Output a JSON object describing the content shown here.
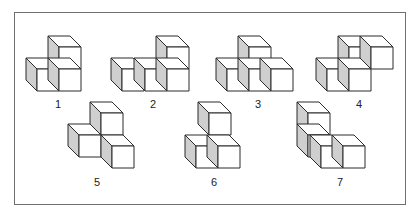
{
  "diagram": {
    "colors": {
      "frame": "#6f6f6f",
      "edge": "#2a2a2a",
      "front_face": "#ffffff",
      "top_face": "#ffffff",
      "side_face": "#cfcfcf"
    },
    "cube": {
      "size": 22,
      "depth": 11
    },
    "figures": [
      {
        "label": "1",
        "label_pos": [
          58,
          104
        ],
        "cubes": [
          [
            59,
            47
          ],
          [
            37,
            69
          ],
          [
            59,
            69
          ]
        ]
      },
      {
        "label": "2",
        "label_pos": [
          153,
          104
        ],
        "cubes": [
          [
            167,
            47
          ],
          [
            122,
            69
          ],
          [
            145,
            69
          ],
          [
            167,
            69
          ]
        ]
      },
      {
        "label": "3",
        "label_pos": [
          258,
          104
        ],
        "cubes": [
          [
            249,
            47
          ],
          [
            227,
            69
          ],
          [
            249,
            69
          ],
          [
            271,
            69
          ]
        ]
      },
      {
        "label": "4",
        "label_pos": [
          359,
          104
        ],
        "cubes": [
          [
            349,
            47
          ],
          [
            371,
            47
          ],
          [
            327,
            69
          ],
          [
            349,
            69
          ]
        ]
      },
      {
        "label": "5",
        "label_pos": [
          97,
          182
        ],
        "cubes": [
          [
            101,
            113
          ],
          [
            79,
            135
          ],
          [
            112,
            146
          ]
        ]
      },
      {
        "label": "6",
        "label_pos": [
          214,
          182
        ],
        "cubes": [
          [
            209,
            113
          ],
          [
            196,
            146
          ],
          [
            218,
            146
          ]
        ]
      },
      {
        "label": "7",
        "label_pos": [
          340,
          182
        ],
        "cubes": [
          [
            308,
            113
          ],
          [
            308,
            135
          ],
          [
            321,
            146
          ],
          [
            343,
            146
          ]
        ]
      }
    ]
  }
}
